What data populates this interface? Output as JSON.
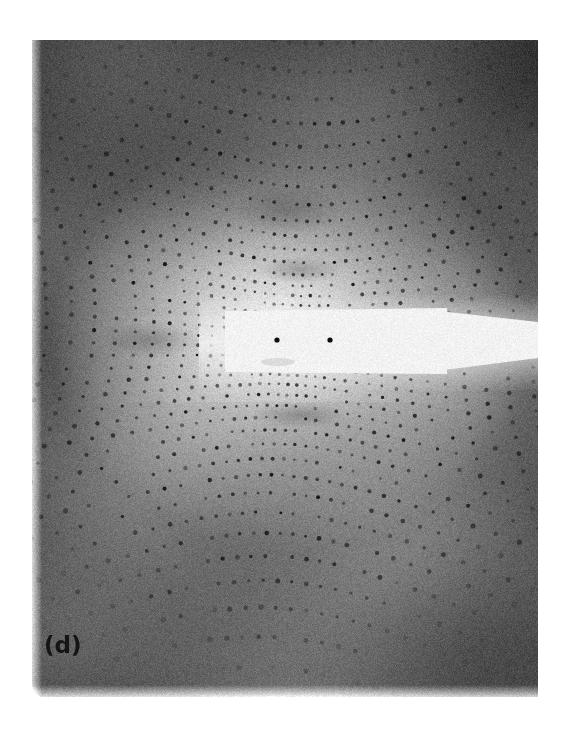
{
  "figure": {
    "type": "x-ray-diffraction-pattern",
    "panel_label": "(d)",
    "background_color": "#ffffff",
    "plate": {
      "left": 32,
      "top": 40,
      "width": 506,
      "height": 657,
      "base_gray": "#9a9a9a",
      "grain": true
    },
    "halo": {
      "center_x": 258,
      "center_y": 300,
      "radius_x": 240,
      "radius_y": 210,
      "bright_color": "#e8e8e8",
      "dark_color": "#6a6a6a"
    },
    "vignette": {
      "top_band_gray": "#5e5e5e",
      "bottom_band_gray": "#7b7b7b",
      "corner_gray": "#767676"
    },
    "lattice": {
      "rotation_deg": 3.0,
      "spacing_center_px": 8.5,
      "spacing_edge_px": 17.0,
      "spot_color": "#1b1b1b",
      "spot_radius_center_px": 1.4,
      "spot_radius_edge_px": 2.6,
      "center_x": 258,
      "center_y": 300
    },
    "beam_stop": {
      "color": "#f2f1ee",
      "paddle": {
        "x": 193,
        "y": 268,
        "width": 222,
        "height": 66
      },
      "arm": {
        "x": 380,
        "y": 282,
        "width": 126,
        "height": 36
      },
      "center_spots": [
        {
          "x": 245,
          "y": 300,
          "radius": 2.6
        },
        {
          "x": 298,
          "y": 300,
          "radius": 2.6
        }
      ]
    },
    "diffuse_clusters": [
      {
        "x": 268,
        "y": 230,
        "rx": 42,
        "ry": 14
      },
      {
        "x": 255,
        "y": 170,
        "rx": 55,
        "ry": 26
      },
      {
        "x": 268,
        "y": 375,
        "rx": 48,
        "ry": 13
      },
      {
        "x": 118,
        "y": 300,
        "rx": 50,
        "ry": 18
      }
    ]
  }
}
